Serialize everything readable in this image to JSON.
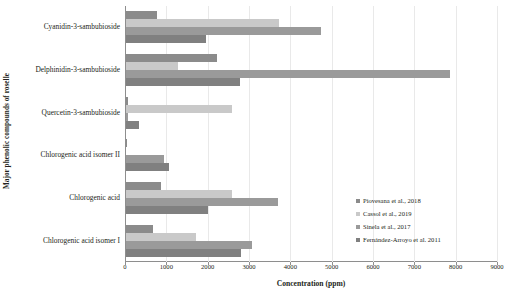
{
  "chart_data": {
    "type": "bar",
    "orientation": "horizontal",
    "title": "",
    "xlabel": "Concentration (ppm)",
    "ylabel": "Major phenolic compounds of roselle",
    "xlim": [
      0,
      9000
    ],
    "xticks": [
      0,
      1000,
      2000,
      3000,
      4000,
      5000,
      6000,
      7000,
      8000,
      9000
    ],
    "xtick_labels": [
      "0",
      "1000",
      "2000",
      "3000",
      "4000",
      "5000",
      "6000",
      "7000",
      "8000",
      "9000"
    ],
    "grid": "vertical-light",
    "legend_position": "inside-right",
    "categories": [
      "Cyanidin-3-sambubioside",
      "Delphinidin-3-sambubioside",
      "Quercetin-3-sambubioside",
      "Chlorogenic acid isomer II",
      "Chlorogenic acid",
      "Chlorogenic acid isomer I"
    ],
    "series": [
      {
        "name": "Piovesana et al., 2018",
        "color": "#8b8b8b",
        "values": [
          740,
          2200,
          60,
          30,
          850,
          660
        ]
      },
      {
        "name": "Cassol et al., 2019",
        "color": "#c9c9c9",
        "values": [
          3690,
          1260,
          2560,
          0,
          2560,
          1700
        ]
      },
      {
        "name": "Sinela et al., 2017",
        "color": "#9a9a9a",
        "values": [
          4710,
          7830,
          60,
          920,
          3680,
          3040
        ]
      },
      {
        "name": "Fernández-Arroyo et al. 2011",
        "color": "#808080",
        "values": [
          1940,
          2750,
          320,
          1040,
          1980,
          2790
        ]
      }
    ]
  }
}
